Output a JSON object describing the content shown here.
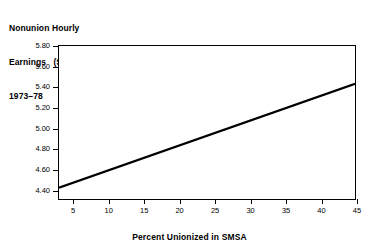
{
  "chart_data": {
    "type": "line",
    "title": "Nonunion Hourly Earnings ($) 1973–78",
    "title_lines": [
      "Nonunion Hourly",
      "Earnings   ($)",
      "1973–78"
    ],
    "xlabel": "Percent Unionized in SMSA",
    "ylabel": "",
    "xlim": [
      3,
      45
    ],
    "ylim": [
      4.3,
      5.8
    ],
    "xticks": [
      5,
      10,
      15,
      20,
      25,
      30,
      35,
      40,
      45
    ],
    "xtick_labels": [
      "5",
      "10",
      "15",
      "20",
      "25",
      "30",
      "35",
      "40",
      "45"
    ],
    "yticks": [
      4.4,
      4.6,
      4.8,
      5.0,
      5.2,
      5.4,
      5.6,
      5.8
    ],
    "ytick_labels": [
      "4.40",
      "4.60",
      "4.80",
      "5.00",
      "5.20",
      "5.40",
      "5.60",
      "5.80"
    ],
    "grid": false,
    "legend": false,
    "series": [
      {
        "name": "Nonunion hourly earnings",
        "color": "#000000",
        "line_width": 2.2,
        "x": [
          3.0,
          45.0
        ],
        "y": [
          4.41,
          5.43
        ]
      }
    ]
  }
}
